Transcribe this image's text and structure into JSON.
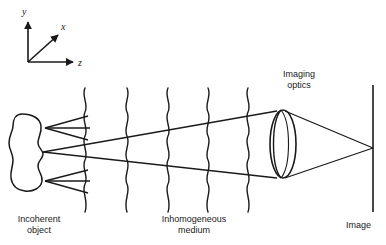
{
  "figure": {
    "background_color": "#ffffff",
    "stroke_color": "#1a1a1a",
    "text_color": "#1a1a1a"
  },
  "axes": {
    "name": "coordinate-triad",
    "origin": {
      "x": 28,
      "y": 62
    },
    "labels": {
      "y": "y",
      "x": "x",
      "z": "z"
    },
    "directions": {
      "y": "up",
      "x": "diagonal-up-right",
      "z": "right"
    }
  },
  "labels": {
    "incoherent_object": "Incoherent\nobject",
    "inhomogeneous_medium": "Inhomogeneous\nmedium",
    "imaging_optics": "Imaging\noptics",
    "image": "Image"
  },
  "object": {
    "name": "incoherent-object-blob",
    "shape": "irregular-closed-blob",
    "bounds": {
      "x": 8,
      "y": 114,
      "width": 36,
      "height": 78
    },
    "source_point": {
      "x": 43,
      "y": 152
    }
  },
  "illumination_arrows": {
    "name": "illumination-arrows",
    "count": 2,
    "direction": "pointing-left-into-object",
    "upper": {
      "tip_x": 43,
      "tip_y": 128,
      "tail_x": 90,
      "tail_y": 118
    },
    "lower": {
      "tip_x": 43,
      "tip_y": 182,
      "tail_x": 90,
      "tail_y": 192
    }
  },
  "medium": {
    "name": "inhomogeneous-medium",
    "wavy_line_count": 5,
    "wavy_line_x_positions": [
      85,
      127,
      168,
      208,
      248
    ],
    "wavy_line_top_y": 88,
    "wavy_line_bottom_y": 212,
    "wave_amplitude": 4,
    "wave_period": 24
  },
  "lens": {
    "name": "imaging-optics-lens",
    "type": "biconvex-3d",
    "front_ellipse": {
      "cx": 281,
      "cy": 144,
      "rx": 14,
      "ry": 34
    },
    "back_edge_offset": -12,
    "aperture_top": {
      "x": 276,
      "y": 111
    },
    "aperture_bottom": {
      "x": 276,
      "y": 178
    }
  },
  "image_plane": {
    "name": "image-plane-line",
    "x": 373,
    "top_y": 85,
    "bottom_y": 212,
    "focus_point": {
      "x": 373,
      "y": 148
    }
  },
  "rays": {
    "name": "ray-bundle",
    "object_to_lens": [
      {
        "from": [
          43,
          152
        ],
        "to": [
          276,
          111
        ]
      },
      {
        "from": [
          43,
          152
        ],
        "to": [
          276,
          178
        ]
      }
    ],
    "lens_to_image": [
      {
        "from": [
          288,
          111
        ],
        "to": [
          373,
          148
        ]
      },
      {
        "from": [
          288,
          178
        ],
        "to": [
          373,
          148
        ]
      }
    ]
  }
}
